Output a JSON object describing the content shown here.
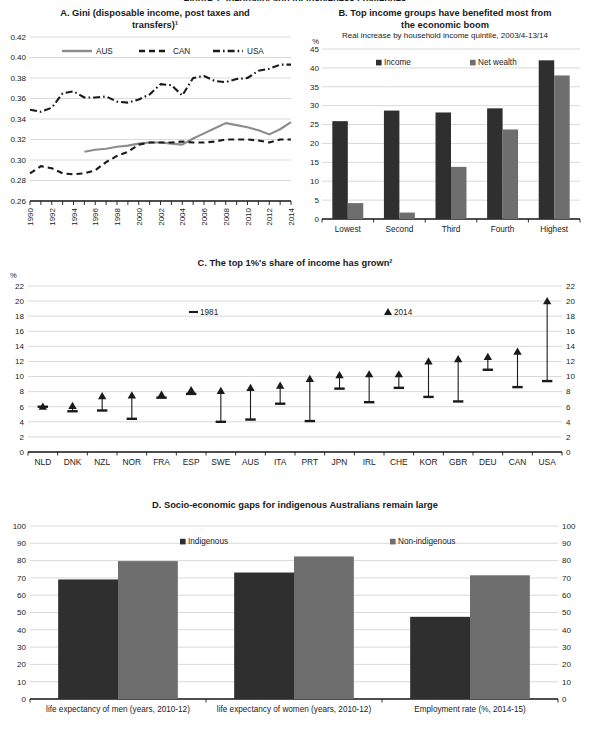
{
  "figure": {
    "cut_title": "Figure 1. Inequality and inclusiveness challenges"
  },
  "panelA": {
    "title_line1": "A. Gini (disposable income, post taxes and",
    "title_line2": "transfers)¹",
    "legend": [
      {
        "label": "AUS",
        "style": "solid",
        "color": "#8c8c8c"
      },
      {
        "label": "CAN",
        "style": "dashed",
        "color": "#1a1a1a"
      },
      {
        "label": "USA",
        "style": "dashdot",
        "color": "#1a1a1a"
      }
    ],
    "yticks": [
      "0.26",
      "0.28",
      "0.30",
      "0.32",
      "0.34",
      "0.36",
      "0.38",
      "0.40",
      "0.42"
    ],
    "xticks": [
      "1990",
      "1992",
      "1994",
      "1996",
      "1998",
      "2000",
      "2002",
      "2004",
      "2006",
      "2008",
      "2010",
      "2012",
      "2014"
    ]
  },
  "panelB": {
    "title_line1": "B. Top income groups have benefited most from",
    "title_line2": "the economic boom",
    "subtitle": "Real increase by household income quintile, 2003/4-13/14",
    "unit": "%",
    "legend": [
      {
        "label": "Income",
        "color": "#2f2f2f"
      },
      {
        "label": "Net wealth",
        "color": "#6e6e6e"
      }
    ],
    "yticks": [
      "0",
      "5",
      "10",
      "15",
      "20",
      "25",
      "30",
      "35",
      "40",
      "45"
    ]
  },
  "panelC": {
    "title": "C. The top 1%'s share of income has grown²",
    "unit": "%",
    "legend": [
      {
        "label": "1981",
        "marker": "dash"
      },
      {
        "label": "2014",
        "marker": "triangle"
      }
    ],
    "yticks": [
      "0",
      "2",
      "4",
      "6",
      "8",
      "10",
      "12",
      "14",
      "16",
      "18",
      "20",
      "22"
    ]
  },
  "panelD": {
    "title": "D. Socio-economic gaps for indigenous Australians remain large",
    "legend": [
      {
        "label": "Indigenous",
        "color": "#2f2f2f"
      },
      {
        "label": "Non-indigenous",
        "color": "#6e6e6e"
      }
    ],
    "yticks": [
      "0",
      "10",
      "20",
      "30",
      "40",
      "50",
      "60",
      "70",
      "80",
      "90",
      "100"
    ]
  },
  "chart_data": [
    {
      "type": "line",
      "panel": "A",
      "title": "A. Gini (disposable income, post taxes and transfers)¹",
      "xlabel": "",
      "ylabel": "",
      "ylim": [
        0.26,
        0.42
      ],
      "ytick_values": [
        0.26,
        0.28,
        0.3,
        0.32,
        0.34,
        0.36,
        0.38,
        0.4,
        0.42
      ],
      "grid": true,
      "legend_position": "top",
      "x": [
        1990,
        1991,
        1992,
        1993,
        1994,
        1995,
        1996,
        1997,
        1998,
        1999,
        2000,
        2001,
        2002,
        2003,
        2004,
        2005,
        2006,
        2007,
        2008,
        2009,
        2010,
        2011,
        2012,
        2013,
        2014
      ],
      "series": [
        {
          "name": "AUS",
          "style": "solid",
          "color": "#8c8c8c",
          "values": [
            null,
            null,
            null,
            null,
            null,
            0.308,
            0.31,
            0.311,
            0.313,
            0.314,
            0.316,
            0.317,
            0.317,
            0.316,
            0.315,
            0.321,
            0.326,
            0.331,
            0.336,
            0.334,
            0.332,
            0.329,
            0.325,
            0.33,
            0.337
          ]
        },
        {
          "name": "CAN",
          "style": "dashed",
          "color": "#1a1a1a",
          "values": [
            0.287,
            0.294,
            0.292,
            0.287,
            0.286,
            0.287,
            0.29,
            0.298,
            0.304,
            0.308,
            0.315,
            0.317,
            0.317,
            0.317,
            0.318,
            0.317,
            0.317,
            0.318,
            0.32,
            0.32,
            0.32,
            0.319,
            0.317,
            0.32,
            0.32
          ]
        },
        {
          "name": "USA",
          "style": "dashdot",
          "color": "#1a1a1a",
          "values": [
            0.349,
            0.347,
            0.351,
            0.365,
            0.367,
            0.361,
            0.361,
            0.362,
            0.357,
            0.356,
            0.359,
            0.364,
            0.374,
            0.373,
            0.363,
            0.38,
            0.382,
            0.377,
            0.376,
            0.379,
            0.38,
            0.387,
            0.389,
            0.393,
            0.393
          ]
        }
      ]
    },
    {
      "type": "bar",
      "panel": "B",
      "title": "B. Top income groups have benefited most from the economic boom",
      "subtitle": "Real increase by household income quintile, 2003/4-13/14",
      "xlabel": "",
      "ylabel": "%",
      "ylim": [
        0,
        45
      ],
      "ytick_values": [
        0,
        5,
        10,
        15,
        20,
        25,
        30,
        35,
        40,
        45
      ],
      "grid": true,
      "legend_position": "top",
      "categories": [
        "Lowest",
        "Second",
        "Third",
        "Fourth",
        "Highest"
      ],
      "series": [
        {
          "name": "Income",
          "color": "#2f2f2f",
          "values": [
            25.9,
            28.7,
            28.2,
            29.3,
            42.0
          ]
        },
        {
          "name": "Net wealth",
          "color": "#6e6e6e",
          "values": [
            4.2,
            1.7,
            13.8,
            23.7,
            38.0
          ]
        }
      ]
    },
    {
      "type": "scatter",
      "panel": "C",
      "title": "C. The top 1%'s share of income has grown²",
      "xlabel": "",
      "ylabel": "%",
      "ylim": [
        0,
        22
      ],
      "ytick_values": [
        0,
        2,
        4,
        6,
        8,
        10,
        12,
        14,
        16,
        18,
        20,
        22
      ],
      "grid": true,
      "legend_position": "top",
      "categories": [
        "NLD",
        "DNK",
        "NZL",
        "NOR",
        "FRA",
        "ESP",
        "SWE",
        "AUS",
        "ITA",
        "PRT",
        "JPN",
        "IRL",
        "CHE",
        "KOR",
        "GBR",
        "DEU",
        "CAN",
        "USA"
      ],
      "series": [
        {
          "name": "1981",
          "marker": "dash",
          "values": [
            6.0,
            5.4,
            5.5,
            4.4,
            7.2,
            7.7,
            4.0,
            4.3,
            6.4,
            4.1,
            8.4,
            6.6,
            8.5,
            7.3,
            6.7,
            10.9,
            8.6,
            9.4
          ]
        },
        {
          "name": "2014",
          "marker": "triangle",
          "values": [
            6.2,
            6.3,
            7.6,
            7.7,
            7.8,
            8.4,
            8.3,
            8.7,
            9.0,
            9.9,
            10.4,
            10.5,
            10.5,
            12.2,
            12.5,
            12.8,
            13.5,
            20.2
          ]
        }
      ]
    },
    {
      "type": "bar",
      "panel": "D",
      "title": "D. Socio-economic gaps for indigenous Australians remain large",
      "xlabel": "",
      "ylabel": "",
      "ylim": [
        0,
        100
      ],
      "ytick_values": [
        0,
        10,
        20,
        30,
        40,
        50,
        60,
        70,
        80,
        90,
        100
      ],
      "grid": true,
      "legend_position": "top",
      "categories": [
        "life expectancy of men (years, 2010-12)",
        "life expectancy of women (years, 2010-12)",
        "Employment rate (%, 2014-15)"
      ],
      "series": [
        {
          "name": "Indigenous",
          "color": "#2f2f2f",
          "values": [
            69.1,
            73.1,
            47.5
          ]
        },
        {
          "name": "Non-indigenous",
          "color": "#6e6e6e",
          "values": [
            79.7,
            82.4,
            71.5
          ]
        }
      ]
    }
  ]
}
